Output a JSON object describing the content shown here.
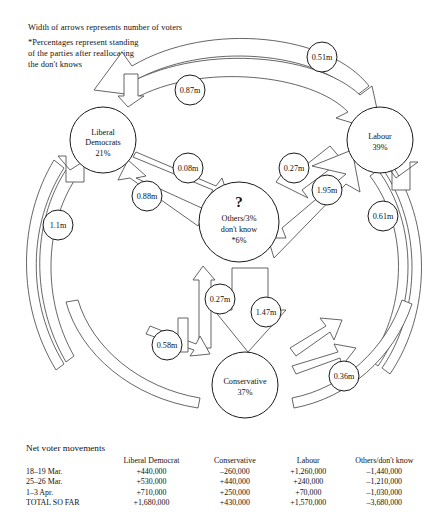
{
  "notes": {
    "width_note": "Width of arrows represents number of voters",
    "pct_note": "*Percentages represent standing\nof the parties after reallocating\nthe don't knows"
  },
  "nodes": [
    {
      "id": "libdem",
      "lines": [
        "Liberal",
        "Democrats",
        "21%"
      ],
      "cx": 103,
      "cy": 140,
      "r": 33
    },
    {
      "id": "labour",
      "lines": [
        "Labour",
        "39%"
      ],
      "cx": 380,
      "cy": 140,
      "r": 33
    },
    {
      "id": "conservative",
      "lines": [
        "Conservative",
        "37%"
      ],
      "cx": 245,
      "cy": 385,
      "r": 33
    },
    {
      "id": "others",
      "lines": [
        "?",
        "Others/3%",
        "don't know",
        "*6%"
      ],
      "cx": 239,
      "cy": 222,
      "r": 40
    }
  ],
  "edge_labels": [
    {
      "id": "lab-to-libdem-outer",
      "value": "0.51m",
      "cx": 322,
      "cy": 57,
      "r": 15
    },
    {
      "id": "lab-to-libdem-inner",
      "value": "0.87m",
      "cx": 190,
      "cy": 90,
      "r": 15
    },
    {
      "id": "libdem-to-others",
      "value": "0.08m",
      "cx": 188,
      "cy": 168,
      "r": 15
    },
    {
      "id": "others-to-labour",
      "value": "0.27m",
      "cx": 294,
      "cy": 168,
      "r": 15
    },
    {
      "id": "others-to-libdem",
      "value": "0.88m",
      "cx": 147,
      "cy": 196,
      "r": 15
    },
    {
      "id": "labour-to-others",
      "value": "1.95m",
      "cx": 327,
      "cy": 190,
      "r": 15
    },
    {
      "id": "labour-inflow",
      "value": "0.61m",
      "cx": 383,
      "cy": 216,
      "r": 15
    },
    {
      "id": "libdem-inflow",
      "value": "1.1m",
      "cx": 58,
      "cy": 225,
      "r": 15
    },
    {
      "id": "cons-to-others",
      "value": "0.27m",
      "cx": 220,
      "cy": 299,
      "r": 15
    },
    {
      "id": "others-to-cons",
      "value": "1.47m",
      "cx": 266,
      "cy": 312,
      "r": 15
    },
    {
      "id": "libdem-to-cons",
      "value": "0.58m",
      "cx": 167,
      "cy": 345,
      "r": 15
    },
    {
      "id": "cons-to-labour",
      "value": "0.36m",
      "cx": 344,
      "cy": 376,
      "r": 15
    }
  ],
  "table": {
    "title": "Net voter movements",
    "columns": [
      "",
      "Liberal Democrat",
      "Conservative",
      "Labour",
      "Others/don't know"
    ],
    "rows": [
      {
        "label": "18–19 Mar.",
        "values": [
          "+440,000",
          "–260,000",
          "+1,260,000",
          "–1,440,000"
        ]
      },
      {
        "label": "25–26 Mar.",
        "values": [
          "+530,000",
          "+440,000",
          "+240,000",
          "–1,210,000"
        ]
      },
      {
        "label": "1–3 Apr.",
        "values": [
          "+710,000",
          "+250,000",
          "+70,000",
          "–1,030,000"
        ]
      },
      {
        "label": "TOTAL SO FAR",
        "values": [
          "+1,680,000",
          "+430,000",
          "+1,570,000",
          "–3,680,000"
        ]
      }
    ]
  }
}
